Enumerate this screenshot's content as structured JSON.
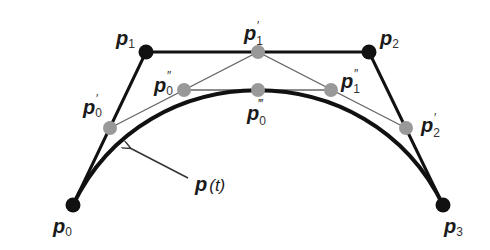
{
  "diagram": {
    "colors": {
      "control_point": "#111111",
      "intermediate_point": "#999999",
      "control_polygon": "#111111",
      "construction_line": "#666666",
      "curve": "#111111"
    },
    "control_points": [
      {
        "id": "p0",
        "base": "p",
        "sub": "0",
        "prime": "",
        "x": 73,
        "y": 205
      },
      {
        "id": "p1",
        "base": "p",
        "sub": "1",
        "prime": "",
        "x": 146,
        "y": 52
      },
      {
        "id": "p2",
        "base": "p",
        "sub": "2",
        "prime": "",
        "x": 369,
        "y": 52
      },
      {
        "id": "p3",
        "base": "p",
        "sub": "3",
        "prime": "",
        "x": 443,
        "y": 205
      }
    ],
    "level1_points": [
      {
        "id": "p0_prime",
        "base": "p",
        "sub": "0",
        "prime": "′",
        "x": 110,
        "y": 128
      },
      {
        "id": "p1_prime",
        "base": "p",
        "sub": "1",
        "prime": "′",
        "x": 258,
        "y": 52
      },
      {
        "id": "p2_prime",
        "base": "p",
        "sub": "2",
        "prime": "′",
        "x": 406,
        "y": 128
      }
    ],
    "level2_points": [
      {
        "id": "p0_dprime",
        "base": "p",
        "sub": "0",
        "prime": "″",
        "x": 184,
        "y": 90
      },
      {
        "id": "p1_dprime",
        "base": "p",
        "sub": "1",
        "prime": "″",
        "x": 331,
        "y": 90
      }
    ],
    "level3_points": [
      {
        "id": "p0_tprime",
        "base": "p",
        "sub": "0",
        "prime": "‴",
        "x": 258,
        "y": 90
      }
    ],
    "labels": {
      "p0": "p",
      "p0_sub": "0",
      "p1": "p",
      "p1_sub": "1",
      "p2": "p",
      "p2_sub": "2",
      "p3": "p",
      "p3_sub": "3",
      "p0p": "p",
      "p0p_sub": "0",
      "p0p_prime": "′",
      "p1p": "p",
      "p1p_sub": "1",
      "p1p_prime": "′",
      "p2p": "p",
      "p2p_sub": "2",
      "p2p_prime": "′",
      "p0pp": "p",
      "p0pp_sub": "0",
      "p0pp_prime": "″",
      "p1pp": "p",
      "p1pp_sub": "1",
      "p1pp_prime": "″",
      "p0ppp": "p",
      "p0ppp_sub": "0",
      "p0ppp_prime": "‴",
      "curve_label_base": "p",
      "curve_label_arg": "(t)"
    }
  }
}
